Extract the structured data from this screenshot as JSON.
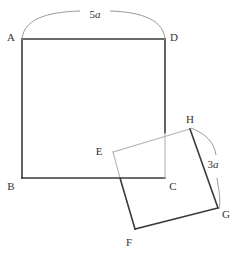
{
  "figure": {
    "type": "geometry-diagram",
    "background_color": "#ffffff",
    "stroke_color": "#3a3a3a",
    "light_stroke_color": "#b4b4b4",
    "label_color": "#333333"
  },
  "vertices": {
    "A": {
      "label": "A",
      "x": 22,
      "y": 39,
      "label_x": 11,
      "label_y": 41
    },
    "B": {
      "label": "B",
      "x": 22,
      "y": 178,
      "label_x": 10,
      "label_y": 189
    },
    "C": {
      "label": "C",
      "x": 165,
      "y": 178,
      "label_x": 170,
      "label_y": 189
    },
    "D": {
      "label": "D",
      "x": 165,
      "y": 39,
      "label_x": 171,
      "label_y": 41
    },
    "E": {
      "label": "E",
      "x": 113,
      "y": 152,
      "label_x": 97,
      "label_y": 154
    },
    "F": {
      "label": "F",
      "x": 135,
      "y": 229,
      "label_x": 126,
      "label_y": 245
    },
    "G": {
      "label": "G",
      "x": 218,
      "y": 208,
      "label_x": 222,
      "label_y": 217
    },
    "H": {
      "label": "H",
      "x": 190,
      "y": 129,
      "label_x": 186,
      "label_y": 123
    }
  },
  "dimensions": {
    "top": {
      "number": "5",
      "unit": "a",
      "text": "5a",
      "label_x": 93,
      "label_y": 18
    },
    "right": {
      "number": "3",
      "unit": "a",
      "text": "3a",
      "label_x": 207,
      "label_y": 167
    }
  },
  "shapes": {
    "square_abcd": {
      "name": "square ABCD",
      "vertices": [
        "A",
        "D",
        "C",
        "B"
      ],
      "side_label": "5a"
    },
    "square_ehgf": {
      "name": "square EHGF",
      "vertices": [
        "E",
        "H",
        "G",
        "F"
      ],
      "side_label": "3a"
    }
  }
}
